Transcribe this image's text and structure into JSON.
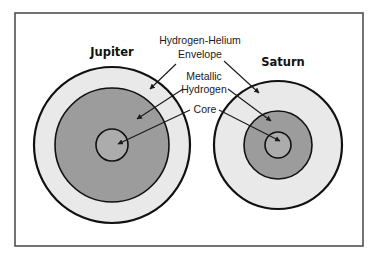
{
  "diagram": {
    "frame": {
      "x": 15,
      "y": 13,
      "width": 348,
      "height": 233,
      "stroke": "#505050"
    },
    "colors": {
      "envelope": "#e9e9e9",
      "metallic_hydrogen": "#9c9c9c",
      "core": "#acacac",
      "outline": "#111111",
      "leader": "#1a1a1a"
    },
    "planets": [
      {
        "name": "Jupiter",
        "label_pos": {
          "x": 112,
          "y": 56
        },
        "center": {
          "x": 112,
          "y": 145
        },
        "r_envelope": 78,
        "r_metallic": 57,
        "r_core": 16
      },
      {
        "name": "Saturn",
        "label_pos": {
          "x": 283,
          "y": 66
        },
        "center": {
          "x": 278,
          "y": 145
        },
        "r_envelope": 64,
        "r_metallic": 34,
        "r_core": 13
      }
    ],
    "layer_labels": [
      {
        "id": "envelope",
        "lines": [
          "Hydrogen-Helium",
          "Envelope"
        ],
        "x": 200,
        "y": [
          44,
          58
        ]
      },
      {
        "id": "metallic",
        "lines": [
          "Metallic",
          "Hydrogen"
        ],
        "x": 204,
        "y": [
          80,
          93
        ]
      },
      {
        "id": "core",
        "lines": [
          "Core"
        ],
        "x": 205,
        "y": [
          113
        ]
      }
    ],
    "leaders": [
      {
        "layer": "envelope",
        "planet": "Jupiter",
        "x1": 176,
        "y1": 64,
        "x2": 150,
        "y2": 89
      },
      {
        "layer": "envelope",
        "planet": "Saturn",
        "x1": 224,
        "y1": 61,
        "x2": 259,
        "y2": 93
      },
      {
        "layer": "metallic",
        "planet": "Jupiter",
        "x1": 183,
        "y1": 89,
        "x2": 137,
        "y2": 119
      },
      {
        "layer": "metallic",
        "planet": "Saturn",
        "x1": 228,
        "y1": 89,
        "x2": 271,
        "y2": 121
      },
      {
        "layer": "core",
        "planet": "Jupiter",
        "x1": 190,
        "y1": 110,
        "x2": 118,
        "y2": 144
      },
      {
        "layer": "core",
        "planet": "Saturn",
        "x1": 219,
        "y1": 110,
        "x2": 280,
        "y2": 141
      }
    ]
  }
}
